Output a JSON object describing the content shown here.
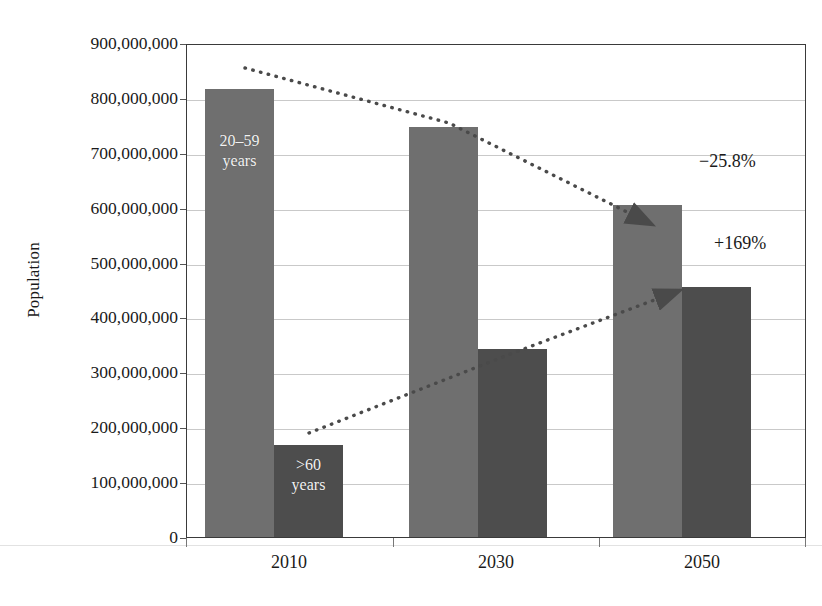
{
  "chart_data": {
    "type": "bar",
    "title": "",
    "subtitle": "",
    "xlabel": "",
    "ylabel": "Population",
    "categories": [
      "2010",
      "2030",
      "2050"
    ],
    "series": [
      {
        "name": "20–59 years",
        "key": "working_age",
        "color": "#6f6f6f",
        "values": [
          820000000,
          750000000,
          607000000
        ]
      },
      {
        "name": ">60 years",
        "key": "older_adults",
        "color": "#4d4d4d",
        "values": [
          169000000,
          344000000,
          457000000
        ]
      }
    ],
    "ylim": [
      0,
      900000000
    ],
    "ytick_values": [
      0,
      100000000,
      200000000,
      300000000,
      400000000,
      500000000,
      600000000,
      700000000,
      800000000,
      900000000
    ],
    "ytick_labels": [
      "0",
      "100,000,000",
      "200,000,000",
      "300,000,000",
      "400,000,000",
      "500,000,000",
      "600,000,000",
      "700,000,000",
      "800,000,000",
      "900,000,000"
    ],
    "grid": true,
    "legend": "none",
    "bar_labels": [
      {
        "text": "20–59\nyears",
        "line1": "20–59",
        "line2": "years",
        "series": "working_age",
        "category": "2010"
      },
      {
        "text": ">60\nyears",
        "line1": ">60",
        "line2": "years",
        "series": "older_adults",
        "category": "2010"
      }
    ],
    "annotations": [
      {
        "id": "decline",
        "label": "−25.8%",
        "series": "working_age",
        "description": "dotted arrow declining from the 2010 20–59 bar to the 2050 20–59 bar"
      },
      {
        "id": "increase",
        "label": "+169%",
        "series": "older_adults",
        "description": "dotted arrow rising from the 2010 >60 bar to the 2050 >60 bar"
      }
    ]
  },
  "colors": {
    "series_light": "#6f6f6f",
    "series_dark": "#4d4d4d",
    "gridline": "#c9c9c9",
    "axis": "#3a3a3a",
    "text": "#1a1a1a",
    "bar_label_text": "#f2f2f2",
    "background": "#ffffff"
  }
}
